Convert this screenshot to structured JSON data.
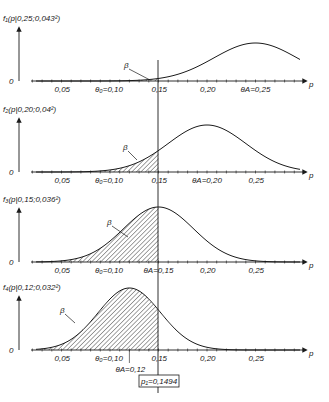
{
  "chart_data": {
    "type": "area",
    "title": "",
    "xlabel": "p",
    "x_ticks": [
      "0,05",
      "0,10",
      "0,15",
      "0,20",
      "0,25"
    ],
    "x_tick_values": [
      0.05,
      0.1,
      0.15,
      0.2,
      0.25
    ],
    "xlim": [
      0.02,
      0.3
    ],
    "critical_value": 0.15,
    "theta_0": 0.1,
    "panels": [
      {
        "ylabel": "f₁(p|0,25;0,043²)",
        "zero_label": "0",
        "mean": 0.25,
        "sd": 0.043,
        "theta_A": 0.25,
        "theta_0_label": "θ₀=0,10",
        "theta_A_label": "θA=0,25",
        "beta_label": "β"
      },
      {
        "ylabel": "f₂(p|0,20;0,04²)",
        "zero_label": "0",
        "mean": 0.2,
        "sd": 0.04,
        "theta_A": 0.2,
        "theta_0_label": "θ₀=0,10",
        "theta_A_label": "θA=0,20",
        "beta_label": "β"
      },
      {
        "ylabel": "f₃(p|0,15;0,036²)",
        "zero_label": "0",
        "mean": 0.15,
        "sd": 0.036,
        "theta_A": 0.15,
        "theta_0_label": "θ₀=0,10",
        "theta_A_label": "θA=0,15",
        "beta_label": "β"
      },
      {
        "ylabel": "f₄(p|0,12;0,032²)",
        "zero_label": "0",
        "mean": 0.12,
        "sd": 0.032,
        "theta_A": 0.12,
        "theta_0_label": "θ₀=0,10",
        "theta_A_label": "θA=0,12",
        "beta_label": "β"
      }
    ],
    "annotation": "p₁=0,1494",
    "grid": false,
    "legend": null
  },
  "labels": {
    "p_axis": "p",
    "ticks": [
      "0,05",
      "0,10",
      "0,15",
      "0,20",
      "0,25"
    ],
    "p1": {
      "ylabel": "f₁(p|0,25;0,043²)",
      "t0": "θ₀=0,10",
      "tA": "θA=0,25",
      "beta": "β",
      "zero": "0"
    },
    "p2": {
      "ylabel": "f₂(p|0,20;0,04²)",
      "t0": "θ₀=0,10",
      "tA": "θA=0,20",
      "beta": "β",
      "zero": "0"
    },
    "p3": {
      "ylabel": "f₃(p|0,15;0,036²)",
      "t0": "θ₀=0,10",
      "tA": "θA=0,15",
      "beta": "β",
      "zero": "0"
    },
    "p4": {
      "ylabel": "f₄(p|0,12;0,032²)",
      "t0": "θ₀=0,10",
      "tA": "θA=0,12",
      "beta": "β",
      "zero": "0"
    },
    "box": "p₁=0,1494"
  }
}
